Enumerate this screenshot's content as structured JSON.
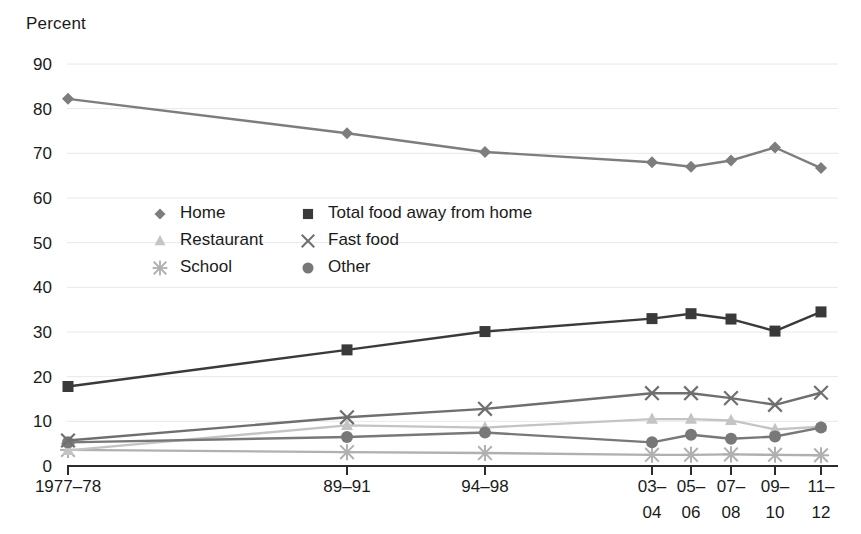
{
  "axis_title": "Percent",
  "chart_data": {
    "type": "line",
    "title": "",
    "subtitle": "",
    "xlabel": "",
    "ylabel": "Percent",
    "ylim": [
      0,
      90
    ],
    "yticks": [
      0,
      10,
      20,
      30,
      40,
      50,
      60,
      70,
      80,
      90
    ],
    "grid": true,
    "legend_position": "inside-upper-left",
    "categories": [
      "1977–78",
      "89–91",
      "94–98",
      "03–04",
      "05–06",
      "07–08",
      "09–10",
      "11–12"
    ],
    "category_lines": [
      [
        "1977–78"
      ],
      [
        "89–91"
      ],
      [
        "94–98"
      ],
      [
        "03–",
        "04"
      ],
      [
        "05–",
        "06"
      ],
      [
        "07–",
        "08"
      ],
      [
        "09–",
        "10"
      ],
      [
        "11–",
        "12"
      ]
    ],
    "series": [
      {
        "name": "Home",
        "marker": "diamond",
        "color": "#7d7d7d",
        "values": [
          82.2,
          74.5,
          70.3,
          68.0,
          67.0,
          68.4,
          71.3,
          66.7
        ]
      },
      {
        "name": "Total food away from home",
        "marker": "square",
        "color": "#3a3a3a",
        "values": [
          17.8,
          26.0,
          30.1,
          33.0,
          34.1,
          32.9,
          30.2,
          34.5
        ]
      },
      {
        "name": "Restaurant",
        "marker": "triangle",
        "color": "#c4c4c4",
        "values": [
          3.5,
          9.1,
          8.6,
          10.5,
          10.5,
          10.2,
          8.2,
          8.8
        ]
      },
      {
        "name": "Fast food",
        "marker": "cross",
        "color": "#6f6f6f",
        "values": [
          5.7,
          10.9,
          12.8,
          16.3,
          16.3,
          15.2,
          13.7,
          16.4
        ]
      },
      {
        "name": "School",
        "marker": "star",
        "color": "#b0b0b0",
        "values": [
          3.6,
          3.1,
          2.9,
          2.5,
          2.5,
          2.6,
          2.5,
          2.4
        ]
      },
      {
        "name": "Other",
        "marker": "circle",
        "color": "#787878",
        "values": [
          5.3,
          6.5,
          7.5,
          5.3,
          7.0,
          6.1,
          6.6,
          8.6
        ]
      }
    ],
    "legend": [
      {
        "label": "Home",
        "marker": "diamond",
        "color": "#7d7d7d"
      },
      {
        "label": "Total food away from home",
        "marker": "square",
        "color": "#3a3a3a"
      },
      {
        "label": "Restaurant",
        "marker": "triangle",
        "color": "#c4c4c4"
      },
      {
        "label": "Fast food",
        "marker": "cross",
        "color": "#6f6f6f"
      },
      {
        "label": "School",
        "marker": "star",
        "color": "#b0b0b0"
      },
      {
        "label": "Other",
        "marker": "circle",
        "color": "#787878"
      }
    ]
  }
}
